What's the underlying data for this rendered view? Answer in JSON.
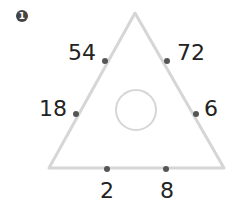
{
  "problem_number": "1",
  "labels": {
    "top_left": "54",
    "top_right": "72",
    "mid_left": "18",
    "mid_right": "6",
    "bottom_left": "2",
    "bottom_right": "8"
  },
  "center_circle_value": "",
  "colors": {
    "triangle": "#d6d6d6",
    "dot": "#555555",
    "text": "#222222"
  }
}
